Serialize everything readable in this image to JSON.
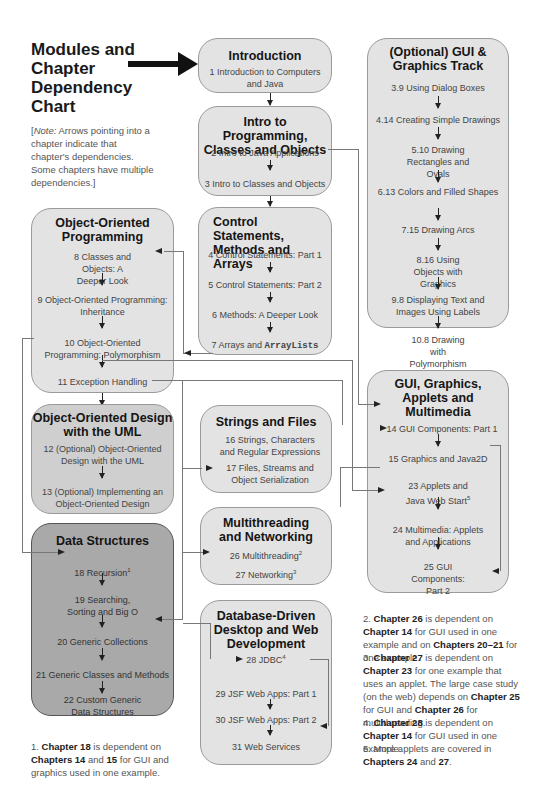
{
  "header": {
    "title": "Modules and Chapter Dependency Chart",
    "note_prefix": "[",
    "note_italic": "Note:",
    "note_text": " Arrows pointing into a chapter indicate that chapter's dependencies. Some chapters have multiple dependencies.]"
  },
  "modules": {
    "introduction": {
      "title": "Introduction",
      "items": [
        "1 Introduction to Computers and Java"
      ]
    },
    "intro_programming": {
      "title": "Intro to Programming, Classes and Objects",
      "items": [
        "2 Intro to Java Applications",
        "3 Intro to Classes and Objects"
      ]
    },
    "control": {
      "title": "Control Statements, Methods and Arrays",
      "items": [
        "4 Control Statements: Part 1",
        "5 Control Statements: Part 2",
        "6 Methods: A Deeper Look",
        "7 Arrays and ",
        "ArrayLists"
      ]
    },
    "oop": {
      "title": "Object-Oriented Programming",
      "items": [
        "8 Classes and Objects: A Deeper Look",
        "9 Object-Oriented Programming: Inheritance",
        "10 Object-Oriented Programming: Polymorphism",
        "11 Exception Handling"
      ]
    },
    "ood_uml": {
      "title": "Object-Oriented Design with the UML",
      "items": [
        "12 (Optional) Object-Oriented Design with the UML",
        "13 (Optional) Implementing an Object-Oriented Design"
      ]
    },
    "strings_files": {
      "title": "Strings and Files",
      "items": [
        "16 Strings, Characters and Regular Expressions",
        "17 Files, Streams and Object Serialization"
      ]
    },
    "data_structures": {
      "title": "Data Structures",
      "items": [
        "18 Recursion",
        "19 Searching, Sorting and Big O",
        "20 Generic Collections",
        "21 Generic Classes and Methods",
        "22 Custom Generic Data Structures"
      ],
      "sup": "1"
    },
    "multithreading": {
      "title": "Multithreading and Networking",
      "items": [
        "26 Multithreading",
        "27 Networking"
      ],
      "sups": [
        "2",
        "3"
      ]
    },
    "database": {
      "title": "Database-Driven Desktop and Web Development",
      "items": [
        "28 JDBC",
        "29 JSF Web Apps: Part 1",
        "30 JSF Web Apps: Part 2",
        "31 Web Services"
      ],
      "sup": "4"
    },
    "gui_track": {
      "title": "(Optional) GUI & Graphics Track",
      "items": [
        "3.9 Using Dialog Boxes",
        "4.14 Creating Simple Drawings",
        "5.10 Drawing Rectangles and Ovals",
        "6.13 Colors and Filled Shapes",
        "7.15 Drawing Arcs",
        "8.16 Using Objects with Graphics",
        "9.8 Displaying Text and Images Using Labels",
        "10.8 Drawing with Polymorphism"
      ]
    },
    "gui_applets": {
      "title": "GUI, Graphics, Applets and Multimedia",
      "items": [
        "14 GUI Components: Part 1",
        "15 Graphics and Java2D",
        "23 Applets and Java Web Start",
        "24 Multimedia: Applets and Applications",
        "25 GUI Components: Part 2"
      ],
      "sup": "5"
    }
  },
  "footnotes": {
    "f1": {
      "n": "1.",
      "parts": [
        "Chapter 18",
        " is dependent on ",
        "Chapters 14",
        " and ",
        "15",
        " for GUI and graphics used in one example."
      ]
    },
    "f2": {
      "n": "2.",
      "parts": [
        "Chapter 26",
        " is dependent on ",
        "Chapter 14",
        " for GUI used in one example and on ",
        "Chapters 20–21",
        " for one example."
      ]
    },
    "f3": {
      "n": "3.",
      "parts": [
        "Chapter 27",
        " is dependent on ",
        "Chapter 23",
        " for one example that uses an applet. The large case study (on the web) depends on ",
        "Chapter 25",
        " for GUI and ",
        "Chapter 26",
        " for multithreading."
      ]
    },
    "f4": {
      "n": "4.",
      "parts": [
        "Chapter 28",
        " is dependent on ",
        "Chapter 14",
        " for GUI used in one example."
      ]
    },
    "f5": {
      "n": "5.",
      "parts": [
        "More applets are covered in ",
        "Chapters 24",
        " and ",
        "27",
        "."
      ]
    }
  }
}
